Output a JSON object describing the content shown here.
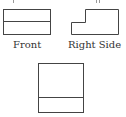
{
  "diagram": {
    "type": "orthographic-projection",
    "stroke_color": "#444444",
    "views": [
      {
        "id": "front",
        "label": "Front"
      },
      {
        "id": "right-side",
        "label": "Right Side"
      },
      {
        "id": "top",
        "label": ""
      }
    ]
  }
}
